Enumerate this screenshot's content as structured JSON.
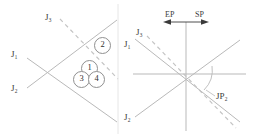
{
  "figure": {
    "title": "",
    "stroke_color": "#b9b9b9",
    "dash_color": "#c4c4c4",
    "text_color": "#3a3a3a",
    "divider_color": "#e2e2e2"
  },
  "left_panel": {
    "name": "left-configuration-diagram",
    "labels": {
      "j3": "J₃",
      "j1": "J₁",
      "j2": "J₂"
    },
    "regions": [
      {
        "id": "region-2",
        "label": "2"
      },
      {
        "id": "region-1",
        "label": "1"
      },
      {
        "id": "region-3",
        "label": "3"
      },
      {
        "id": "region-4",
        "label": "4"
      }
    ]
  },
  "right_panel": {
    "name": "right-stress-space-diagram",
    "labels": {
      "ep": "EP",
      "sp": "SP",
      "j3": "J₃",
      "j1": "J₁",
      "j2": "J₂",
      "jp2": "JP₂"
    },
    "arrows": {
      "ep_direction": "left",
      "sp_direction": "right"
    },
    "arc": {
      "name": "angle-arc",
      "label": "JP₂"
    }
  }
}
